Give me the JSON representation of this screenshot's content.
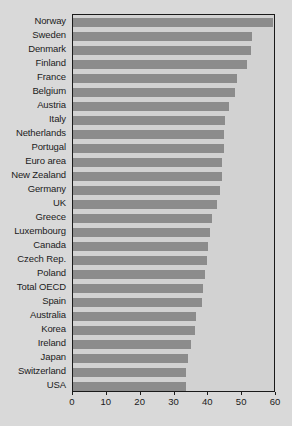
{
  "chart_data": {
    "type": "bar",
    "orientation": "horizontal",
    "title": "",
    "subtitle": "",
    "xlabel": "",
    "ylabel": "",
    "xlim": [
      0,
      60
    ],
    "ylim": null,
    "grid": false,
    "legend": null,
    "legend_position": "none",
    "xticks": [
      0,
      10,
      20,
      30,
      40,
      50,
      60
    ],
    "xtick_labels": [
      "0",
      "10",
      "20",
      "30",
      "40",
      "50",
      "60"
    ],
    "categories": [
      "Norway",
      "Sweden",
      "Denmark",
      "Finland",
      "France",
      "Belgium",
      "Austria",
      "Italy",
      "Netherlands",
      "Portugal",
      "Euro area",
      "New Zealand",
      "Germany",
      "UK",
      "Greece",
      "Luxembourg",
      "Canada",
      "Czech Rep.",
      "Poland",
      "Total OECD",
      "Spain",
      "Australia",
      "Korea",
      "Ireland",
      "Japan",
      "Switzerland",
      "USA"
    ],
    "values": [
      59.0,
      53.0,
      52.5,
      51.5,
      48.5,
      48.0,
      46.0,
      45.0,
      44.5,
      44.5,
      44.0,
      44.0,
      43.5,
      42.5,
      41.0,
      40.5,
      40.0,
      39.5,
      39.0,
      38.5,
      38.0,
      36.5,
      36.0,
      35.0,
      34.0,
      33.5,
      33.5
    ],
    "bar_color": "#8c8c8c",
    "plot_background": "#d2d2d2",
    "figure_background": "#d9d9d9",
    "axis_color": "#1a1a1a"
  }
}
